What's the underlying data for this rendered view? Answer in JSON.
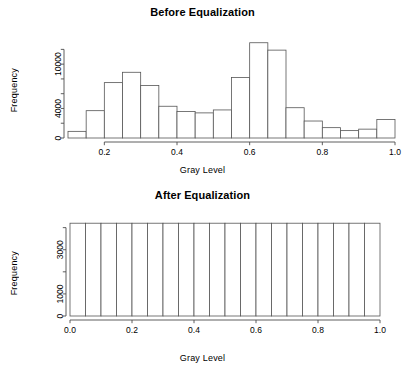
{
  "figure": {
    "background": "#ffffff",
    "line_color": "#4d4d4d",
    "bar_fill": "#ffffff",
    "bar_stroke": "#555555",
    "text_color": "#000000"
  },
  "panels": [
    {
      "id": "before",
      "title": "Before Equalization",
      "xlabel": "Gray Level",
      "ylabel": "Frequency"
    },
    {
      "id": "after",
      "title": "After Equalization",
      "xlabel": "Gray Level",
      "ylabel": "Frequency"
    }
  ],
  "chart_data": [
    {
      "type": "bar",
      "id": "before-equalization-histogram",
      "title": "Before Equalization",
      "xlabel": "Gray Level",
      "ylabel": "Frequency",
      "xlim": [
        0.1,
        1.0
      ],
      "ylim": [
        0,
        13000
      ],
      "xticks": [
        0.2,
        0.4,
        0.6,
        0.8,
        1.0
      ],
      "xtick_labels": [
        "0.2",
        "0.4",
        "0.6",
        "0.8",
        "1.0"
      ],
      "yticks": [
        0,
        2000,
        4000,
        6000,
        8000,
        10000,
        12000
      ],
      "ytick_labels": [
        "0",
        "",
        "4000",
        "",
        "",
        "10000",
        ""
      ],
      "labeled_yticks": [
        0,
        4000,
        10000
      ],
      "grid": false,
      "legend": false,
      "bin_width": 0.05,
      "bin_edges": [
        0.1,
        0.15,
        0.2,
        0.25,
        0.3,
        0.35,
        0.4,
        0.45,
        0.5,
        0.55,
        0.6,
        0.65,
        0.7,
        0.75,
        0.8,
        0.85,
        0.9,
        0.95,
        1.0
      ],
      "bin_centers": [
        0.125,
        0.175,
        0.225,
        0.275,
        0.325,
        0.375,
        0.425,
        0.475,
        0.525,
        0.575,
        0.625,
        0.675,
        0.725,
        0.775,
        0.825,
        0.875,
        0.925,
        0.975
      ],
      "values": [
        900,
        3700,
        7500,
        8900,
        7100,
        4300,
        3600,
        3400,
        3800,
        8200,
        12900,
        11900,
        4100,
        2300,
        1400,
        1000,
        1200,
        2500
      ]
    },
    {
      "type": "bar",
      "id": "after-equalization-histogram",
      "title": "After Equalization",
      "xlabel": "Gray Level",
      "ylabel": "Frequency",
      "xlim": [
        0.0,
        1.0
      ],
      "ylim": [
        0,
        4300
      ],
      "xticks": [
        0.0,
        0.2,
        0.4,
        0.6,
        0.8,
        1.0
      ],
      "xtick_labels": [
        "0.0",
        "0.2",
        "0.4",
        "0.6",
        "0.8",
        "1.0"
      ],
      "yticks": [
        0,
        1000,
        2000,
        3000,
        4000
      ],
      "ytick_labels": [
        "0",
        "1000",
        "",
        "3000",
        ""
      ],
      "labeled_yticks": [
        0,
        1000,
        3000
      ],
      "grid": false,
      "legend": false,
      "bin_width": 0.05,
      "bin_edges": [
        0.0,
        0.05,
        0.1,
        0.15,
        0.2,
        0.25,
        0.3,
        0.35,
        0.4,
        0.45,
        0.5,
        0.55,
        0.6,
        0.65,
        0.7,
        0.75,
        0.8,
        0.85,
        0.9,
        0.95,
        1.0
      ],
      "bin_centers": [
        0.025,
        0.075,
        0.125,
        0.175,
        0.225,
        0.275,
        0.325,
        0.375,
        0.425,
        0.475,
        0.525,
        0.575,
        0.625,
        0.675,
        0.725,
        0.775,
        0.825,
        0.875,
        0.925,
        0.975
      ],
      "values": [
        4200,
        4200,
        4200,
        4200,
        4200,
        4200,
        4200,
        4200,
        4200,
        4200,
        4200,
        4200,
        4200,
        4200,
        4200,
        4200,
        4200,
        4200,
        4200,
        4200
      ]
    }
  ]
}
